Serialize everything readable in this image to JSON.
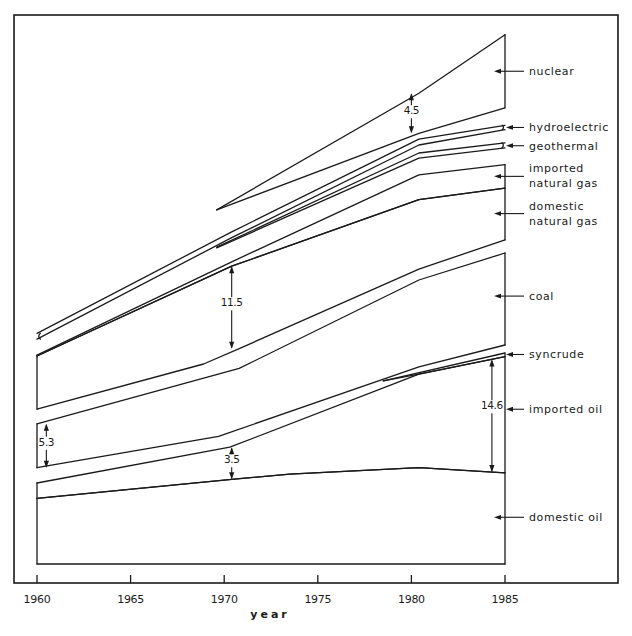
{
  "chart_data": {
    "type": "area",
    "title": "",
    "xlabel": "year",
    "ylabel": "",
    "xlim": [
      1960,
      1985
    ],
    "ylim": [
      0,
      75
    ],
    "grid": false,
    "legend": "right (labels with arrows)",
    "x_ticks": [
      1960,
      1965,
      1970,
      1975,
      1980,
      1985
    ],
    "x_tick_labels": [
      "1960",
      "1965",
      "1970",
      "1975",
      "1980",
      "1985"
    ],
    "note": "Exploded stacked bands; y values are relative energy units estimated from annotated gaps",
    "series": [
      {
        "name": "domestic oil",
        "lower": [
          [
            1960,
            0
          ],
          [
            1985,
            0
          ]
        ],
        "upper": [
          [
            1960,
            9.0
          ],
          [
            1970.4,
            11.6
          ],
          [
            1973.5,
            12.3
          ],
          [
            1980.4,
            13.2
          ],
          [
            1985,
            12.5
          ]
        ]
      },
      {
        "name": "imported oil",
        "lower": [
          [
            1960,
            9.0
          ],
          [
            1970.4,
            11.6
          ],
          [
            1973.5,
            12.3
          ],
          [
            1980.4,
            13.2
          ],
          [
            1985,
            12.5
          ]
        ],
        "upper": [
          [
            1960,
            11.1
          ],
          [
            1970.3,
            16.0
          ],
          [
            1980.4,
            26.0
          ],
          [
            1985,
            28.4
          ]
        ]
      },
      {
        "name": "syncrude",
        "lower": [
          [
            1978.5,
            25.1
          ],
          [
            1980.4,
            26.0
          ],
          [
            1985,
            28.4
          ]
        ],
        "upper": [
          [
            1978.5,
            25.1
          ],
          [
            1985,
            28.9
          ]
        ]
      },
      {
        "name": "coal",
        "lower": [
          [
            1960,
            13.2
          ],
          [
            1969.7,
            17.5
          ],
          [
            1980.4,
            27.0
          ],
          [
            1985,
            30.0
          ]
        ],
        "upper": [
          [
            1960,
            19.2
          ],
          [
            1970.8,
            26.8
          ],
          [
            1980.4,
            38.9
          ],
          [
            1985,
            42.6
          ]
        ]
      },
      {
        "name": "domestic natural gas",
        "lower": [
          [
            1960,
            21.2
          ],
          [
            1968.9,
            27.4
          ],
          [
            1970.8,
            29.5
          ],
          [
            1980.4,
            40.4
          ],
          [
            1985,
            44.4
          ]
        ],
        "upper": [
          [
            1960,
            28.5
          ],
          [
            1970.4,
            40.8
          ],
          [
            1980.4,
            49.9
          ],
          [
            1985,
            51.5
          ]
        ]
      },
      {
        "name": "imported natural gas",
        "lower": [
          [
            1960,
            28.5
          ],
          [
            1970.4,
            40.8
          ],
          [
            1980.4,
            49.9
          ],
          [
            1985,
            51.5
          ]
        ],
        "upper": [
          [
            1960,
            28.6
          ],
          [
            1970.4,
            41.4
          ],
          [
            1980.4,
            53.3
          ],
          [
            1985,
            54.7
          ]
        ]
      },
      {
        "name": "geothermal",
        "lower": [
          [
            1969.6,
            43.3
          ],
          [
            1980.4,
            55.6
          ],
          [
            1985,
            57.0
          ]
        ],
        "upper": [
          [
            1969.6,
            43.4
          ],
          [
            1980.4,
            56.3
          ],
          [
            1985,
            57.7
          ]
        ]
      },
      {
        "name": "hydroelectric",
        "lower": [
          [
            1960,
            30.8
          ],
          [
            1970.4,
            44.7
          ],
          [
            1980.4,
            57.4
          ],
          [
            1985,
            59.5
          ]
        ],
        "upper": [
          [
            1960,
            31.6
          ],
          [
            1970.4,
            45.5
          ],
          [
            1980.4,
            58.2
          ],
          [
            1985,
            60.1
          ]
        ]
      },
      {
        "name": "nuclear",
        "lower": [
          [
            1969.6,
            48.5
          ],
          [
            1980.4,
            59.0
          ],
          [
            1985,
            62.5
          ]
        ],
        "upper": [
          [
            1969.6,
            48.5
          ],
          [
            1980.4,
            64.5
          ],
          [
            1985,
            72.5
          ]
        ]
      }
    ],
    "blocks_1960": [
      [
        0,
        11.1
      ],
      [
        13.2,
        19.2
      ],
      [
        21.2,
        28.6
      ],
      [
        30.8,
        31.6
      ]
    ],
    "blocks_1985": [
      [
        0,
        28.9
      ],
      [
        30.0,
        42.6
      ],
      [
        44.4,
        54.7
      ],
      [
        57.0,
        57.7
      ],
      [
        59.5,
        60.1
      ],
      [
        62.5,
        72.5
      ]
    ],
    "labels": [
      {
        "text": "nuclear",
        "lines": [
          "nuclear"
        ],
        "y": 67.5
      },
      {
        "text": "hydroelectric",
        "lines": [
          "hydroelectric"
        ],
        "y": 59.8
      },
      {
        "text": "geothermal",
        "lines": [
          "geothermal"
        ],
        "y": 57.3
      },
      {
        "text": "imported natural gas",
        "lines": [
          "imported",
          "natural gas"
        ],
        "y": 53.1
      },
      {
        "text": "domestic natural gas",
        "lines": [
          "domestic",
          "natural gas"
        ],
        "y": 48.0
      },
      {
        "text": "coal",
        "lines": [
          "coal"
        ],
        "y": 36.7
      },
      {
        "text": "syncrude",
        "lines": [
          "syncrude"
        ],
        "y": 28.7
      },
      {
        "text": "imported oil",
        "lines": [
          "imported oil"
        ],
        "y": 21.2
      },
      {
        "text": "domestic oil",
        "lines": [
          "domestic oil"
        ],
        "y": 6.4
      }
    ],
    "annotations": [
      {
        "text": "4.5",
        "year": 1980.0,
        "from": 59.0,
        "to": 64.5,
        "label_y": 61.6
      },
      {
        "text": "11.5",
        "year": 1970.4,
        "from": 29.5,
        "to": 40.8,
        "label_y": 35.3
      },
      {
        "text": "5.3",
        "year": 1960.5,
        "from": 13.2,
        "to": 19.2,
        "label_y": 16.2
      },
      {
        "text": "3.5",
        "year": 1970.4,
        "from": 11.6,
        "to": 16.0,
        "label_y": 13.8
      },
      {
        "text": "14.6",
        "year": 1984.3,
        "from": 12.6,
        "to": 28.0,
        "label_y": 21.2
      }
    ]
  }
}
